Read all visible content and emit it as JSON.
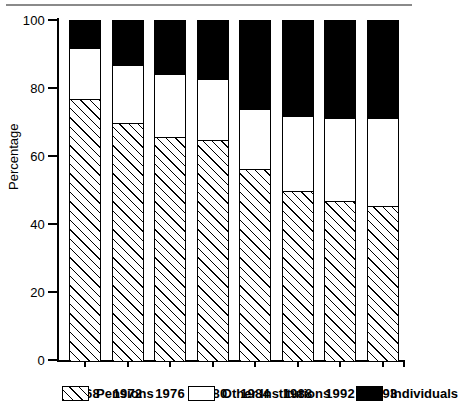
{
  "chart_data": {
    "type": "bar",
    "subtype": "stacked-100-percent",
    "title": "",
    "xlabel": "",
    "ylabel": "Percentage",
    "ylim": [
      0,
      100
    ],
    "yticks": [
      0,
      20,
      40,
      60,
      80,
      100
    ],
    "ytick_labels": [
      "0",
      "20",
      "40",
      "60",
      "80",
      "100"
    ],
    "grid": false,
    "legend_position": "bottom",
    "categories": [
      "1968",
      "1972",
      "1976",
      "1980",
      "1984",
      "1988",
      "1992",
      "1993"
    ],
    "series": [
      {
        "name": "Pensions",
        "fill": "diagonal-hatch",
        "values": [
          77,
          70,
          66,
          65,
          56.5,
          50,
          47,
          45.5
        ]
      },
      {
        "name": "Other Institutions",
        "fill": "white",
        "values": [
          15,
          17,
          18.5,
          18,
          17.5,
          22,
          24.5,
          26
        ]
      },
      {
        "name": "Individuals",
        "fill": "black",
        "values": [
          8,
          13,
          15.5,
          17,
          26,
          28,
          28.5,
          28.5
        ]
      }
    ],
    "cumulative_tops": {
      "pensions": [
        77,
        70,
        66,
        65,
        56.5,
        50,
        47,
        45.5
      ],
      "other": [
        92,
        87,
        84.5,
        83,
        74,
        72,
        71.5,
        71.5
      ],
      "individuals": [
        100,
        100,
        100,
        100,
        100,
        100,
        100,
        100
      ]
    }
  },
  "legend": {
    "items": [
      {
        "label": "Pensions",
        "swatch": "diagonal-hatch-swatch"
      },
      {
        "label": "Other Institutions",
        "swatch": "white-swatch"
      },
      {
        "label": "Individuals",
        "swatch": "black-swatch"
      }
    ]
  },
  "colors": {
    "ink": "#000000",
    "background": "#ffffff",
    "rule": "#8a8a8a"
  }
}
